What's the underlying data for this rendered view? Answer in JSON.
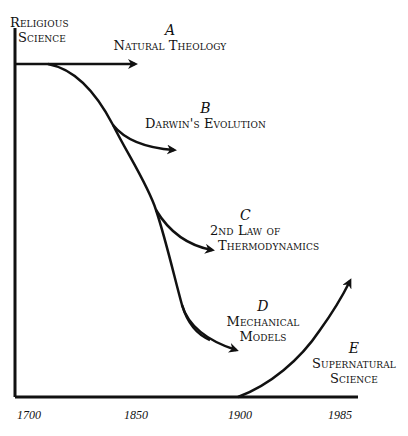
{
  "diagram": {
    "axis": {
      "y_label_lines": [
        "Religious",
        "Science"
      ],
      "x_ticks": [
        "1700",
        "1850",
        "1900",
        "1985"
      ]
    },
    "branches": [
      {
        "id": "A",
        "letter": "A",
        "lines": [
          "Natural Theology"
        ]
      },
      {
        "id": "B",
        "letter": "B",
        "lines": [
          "Darwin's Evolution"
        ]
      },
      {
        "id": "C",
        "letter": "C",
        "lines": [
          "2nd Law of",
          "Thermodynamics"
        ]
      },
      {
        "id": "D",
        "letter": "D",
        "lines": [
          "Mechanical",
          "Models"
        ]
      },
      {
        "id": "E",
        "letter": "E",
        "lines": [
          "Supernatural",
          "Science"
        ]
      }
    ],
    "colors": {
      "ink": "#111111",
      "background": "#ffffff"
    }
  }
}
